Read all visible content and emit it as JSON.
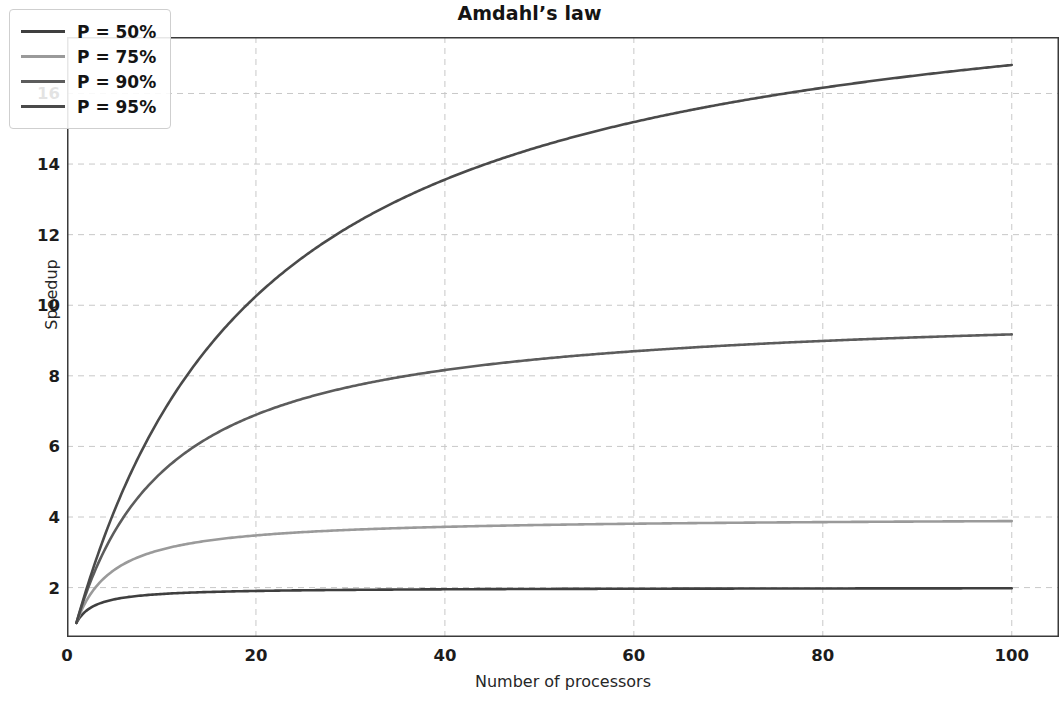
{
  "chart_data": {
    "type": "line",
    "title": "Amdahl’s law",
    "xlabel": "Number of processors",
    "ylabel": "Speedup",
    "xlim": [
      0,
      105
    ],
    "ylim": [
      0.6,
      17.6
    ],
    "grid": true,
    "grid_style": "dashed",
    "legend_position": "upper left",
    "xticks": [
      0,
      20,
      40,
      60,
      80,
      100
    ],
    "yticks": [
      2,
      4,
      6,
      8,
      10,
      12,
      14,
      16
    ],
    "formula": "S(N) = 1 / ((1 - P) + P / N)",
    "x": [
      1,
      2,
      3,
      4,
      5,
      6,
      8,
      10,
      12,
      15,
      20,
      25,
      30,
      35,
      40,
      45,
      50,
      60,
      70,
      80,
      90,
      100
    ],
    "series": [
      {
        "name": "P = 50%",
        "p": 0.5,
        "color": "#3f3f3f",
        "values": [
          1.0,
          1.33,
          1.5,
          1.6,
          1.67,
          1.71,
          1.78,
          1.82,
          1.85,
          1.88,
          1.9,
          1.92,
          1.94,
          1.94,
          1.95,
          1.96,
          1.96,
          1.97,
          1.97,
          1.98,
          1.98,
          1.98
        ]
      },
      {
        "name": "P = 75%",
        "p": 0.75,
        "color": "#9a9a9a",
        "values": [
          1.0,
          1.6,
          2.0,
          2.29,
          2.5,
          2.67,
          2.91,
          3.08,
          3.2,
          3.33,
          3.48,
          3.57,
          3.64,
          3.68,
          3.72,
          3.75,
          3.77,
          3.81,
          3.83,
          3.85,
          3.87,
          3.88
        ]
      },
      {
        "name": "P = 90%",
        "p": 0.9,
        "color": "#5c5c5c",
        "values": [
          1.0,
          1.82,
          2.5,
          3.08,
          3.57,
          4.0,
          4.71,
          5.26,
          5.71,
          6.25,
          6.9,
          7.41,
          7.81,
          8.14,
          8.42,
          8.65,
          8.85,
          9.17,
          9.42,
          9.61,
          9.76,
          9.91
        ]
      },
      {
        "name": "P = 95%",
        "p": 0.95,
        "color": "#4a4a4a",
        "values": [
          1.0,
          1.9,
          2.73,
          3.48,
          4.17,
          4.8,
          5.93,
          6.9,
          7.74,
          8.82,
          10.26,
          11.32,
          12.15,
          12.81,
          13.35,
          13.8,
          14.18,
          14.79,
          15.25,
          15.61,
          15.9,
          16.81
        ]
      }
    ]
  },
  "legend": {
    "entries": [
      {
        "label": "P = 50%"
      },
      {
        "label": "P = 75%"
      },
      {
        "label": "P = 90%"
      },
      {
        "label": "P = 95%"
      }
    ]
  }
}
